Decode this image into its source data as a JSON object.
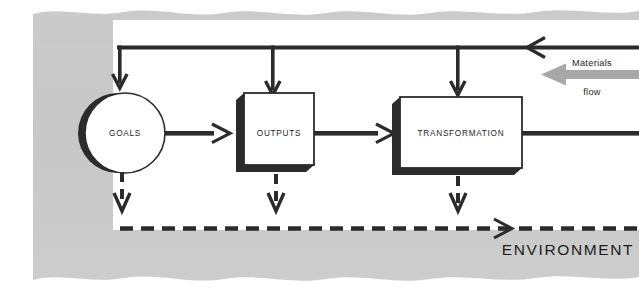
{
  "diagram": {
    "environment_label": "ENVIRONMENT",
    "flow_label_top": "Materials",
    "flow_label_bottom": "flow",
    "nodes": [
      {
        "id": "goals",
        "label": "GOALS",
        "shape": "circle"
      },
      {
        "id": "outputs",
        "label": "OUTPUTS",
        "shape": "box"
      },
      {
        "id": "transformation",
        "label": "TRANSFORMATION",
        "shape": "box"
      }
    ],
    "colors": {
      "environment_band": "#c9c9c9",
      "interior": "#ffffff",
      "line": "#2b2b2b",
      "shadow": "#3a3a3a",
      "flow_arrow": "#a8a8a8",
      "text": "#1c1c1c"
    },
    "legend": {
      "solid_line_meaning": "Materials flow",
      "dashed_line_meaning": "Environment boundary flow"
    }
  }
}
